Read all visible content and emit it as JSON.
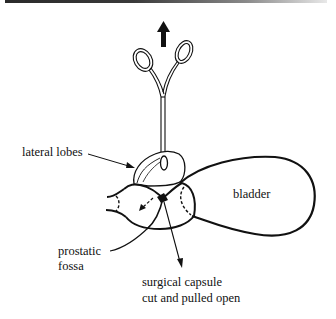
{
  "figure": {
    "labels": {
      "lateral_lobes": "lateral lobes",
      "bladder": "bladder",
      "prostatic_fossa_line1": "prostatic",
      "prostatic_fossa_line2": "fossa",
      "surgical_capsule_line1": "surgical capsule",
      "surgical_capsule_line2": "cut and pulled open"
    },
    "icons": {
      "pull_arrow": "arrow-up",
      "instrument": "forceps"
    },
    "colors": {
      "ink": "#111111",
      "background": "#ffffff"
    }
  }
}
